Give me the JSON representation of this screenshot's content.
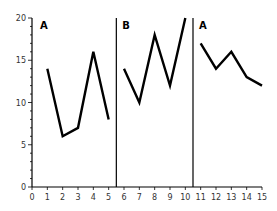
{
  "chart_data": {
    "type": "line",
    "title": "",
    "xlabel": "",
    "ylabel": "",
    "xlim": [
      0,
      15
    ],
    "ylim": [
      0,
      20
    ],
    "x_ticks": [
      0,
      1,
      2,
      3,
      4,
      5,
      6,
      7,
      8,
      9,
      10,
      11,
      12,
      13,
      14,
      15
    ],
    "y_ticks": [
      0,
      5,
      10,
      15,
      20
    ],
    "grid": false,
    "phase_lines": [
      5.5,
      10.5
    ],
    "series": [
      {
        "name": "A",
        "phase_label": "A",
        "x": [
          1,
          2,
          3,
          4,
          5
        ],
        "values": [
          14,
          6,
          7,
          16,
          8
        ]
      },
      {
        "name": "B",
        "phase_label": "B",
        "x": [
          6,
          7,
          8,
          9,
          10
        ],
        "values": [
          14,
          10,
          18,
          12,
          20
        ]
      },
      {
        "name": "A",
        "phase_label": "A",
        "x": [
          11,
          12,
          13,
          14,
          15
        ],
        "values": [
          17,
          14,
          16,
          13,
          12
        ]
      }
    ],
    "colors": {
      "line": "#000000",
      "axis": "#000000",
      "text": "#333333"
    }
  }
}
